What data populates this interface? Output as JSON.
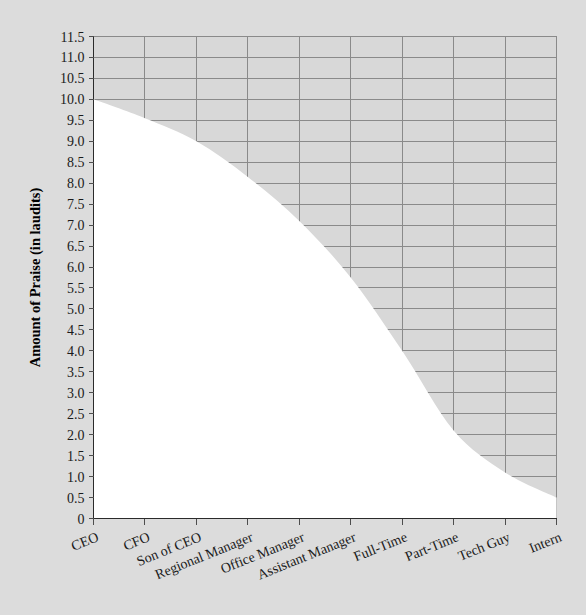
{
  "chart_data": {
    "type": "area",
    "title": "",
    "xlabel": "",
    "ylabel": "Amount of Praise (in laudits)",
    "categories": [
      "CEO",
      "CFO",
      "Son of CEO",
      "Regional Manager",
      "Office Manager",
      "Assistant Manager",
      "Full-Time",
      "Part-Time",
      "Tech Guy",
      "Intern"
    ],
    "values": [
      10.0,
      9.55,
      9.0,
      8.15,
      7.1,
      5.75,
      4.0,
      2.1,
      1.1,
      0.5
    ],
    "series": [
      {
        "name": "Amount of Praise",
        "values": [
          10.0,
          9.55,
          9.0,
          8.15,
          7.1,
          5.75,
          4.0,
          2.1,
          1.1,
          0.5
        ]
      }
    ],
    "ylim": [
      0,
      11.5
    ],
    "ytick_labels": [
      "0",
      "0.5",
      "1.0",
      "1.5",
      "2.0",
      "2.5",
      "3.0",
      "3.5",
      "4.0",
      "4.5",
      "5.0",
      "5.5",
      "6.0",
      "6.5",
      "7.0",
      "7.5",
      "8.0",
      "8.5",
      "9.0",
      "9.5",
      "10.0",
      "10.5",
      "11.0",
      "11.5"
    ],
    "ytick_values": [
      0,
      0.5,
      1.0,
      1.5,
      2.0,
      2.5,
      3.0,
      3.5,
      4.0,
      4.5,
      5.0,
      5.5,
      6.0,
      6.5,
      7.0,
      7.5,
      8.0,
      8.5,
      9.0,
      9.5,
      10.0,
      10.5,
      11.0,
      11.5
    ],
    "grid": true,
    "legend": "none",
    "fill_region": "above-curve",
    "colors": {
      "background": "#dcdcdc",
      "plot_fill": "#d8d8d8",
      "below_curve": "#ffffff",
      "gridline": "#8a8a8a",
      "axis": "#2b2b2b",
      "text": "#1a1a1a"
    }
  }
}
